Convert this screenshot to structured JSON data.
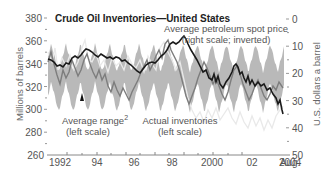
{
  "chart_data": {
    "type": "line",
    "title": "Crude Oil Inventories—United States",
    "ylabel": "Millions of barrels",
    "ylabel_right": "U.S. dollars a barrel",
    "ylim": [
      260,
      380
    ],
    "ylim_right": [
      0,
      50
    ],
    "right_axis_inverted": true,
    "yticks": [
      "380",
      "360",
      "340",
      "320",
      "300",
      "280",
      "260"
    ],
    "yticks_right": [
      "0",
      "10",
      "20",
      "30",
      "40",
      "50"
    ],
    "xticks": [
      "1992",
      "94",
      "96",
      "98",
      "2000",
      "02",
      "Aug.",
      "2004"
    ],
    "x_range": [
      1991.6,
      2004.6
    ],
    "grid": false,
    "series": [
      {
        "name": "Average petroleum spot price (right scale; inverted)",
        "axis": "right",
        "color": "#1a1a1a",
        "x": [
          1991.6,
          1992.0,
          1992.5,
          1993.0,
          1993.5,
          1994.0,
          1994.5,
          1995.0,
          1995.5,
          1996.0,
          1996.5,
          1997.0,
          1997.5,
          1998.0,
          1998.5,
          1998.8,
          1999.0,
          1999.5,
          2000.0,
          2000.5,
          2001.0,
          2001.5,
          2001.8,
          2002.0,
          2002.5,
          2003.0,
          2003.5,
          2004.0,
          2004.4,
          2004.6
        ],
        "values": [
          19,
          21,
          19,
          18,
          15,
          13,
          14,
          15,
          16,
          17,
          20,
          17,
          16,
          14,
          9,
          7,
          11,
          17,
          23,
          26,
          25,
          29,
          22,
          24,
          26,
          28,
          29,
          31,
          34,
          37
        ]
      },
      {
        "name": "Actual inventories (left scale)",
        "axis": "left",
        "color": "#7a7a7a",
        "x": [
          1991.6,
          1992.0,
          1992.5,
          1993.0,
          1993.5,
          1994.0,
          1994.5,
          1995.0,
          1995.5,
          1996.0,
          1996.5,
          1997.0,
          1997.5,
          1998.0,
          1998.5,
          1999.0,
          1999.5,
          2000.0,
          2000.5,
          2001.0,
          2001.5,
          2002.0,
          2002.5,
          2003.0,
          2003.5,
          2004.0,
          2004.6
        ],
        "values": [
          335,
          342,
          326,
          330,
          322,
          318,
          326,
          315,
          300,
          298,
          292,
          310,
          318,
          338,
          345,
          325,
          300,
          292,
          286,
          302,
          312,
          318,
          300,
          284,
          292,
          296,
          300
        ]
      },
      {
        "name": "Average range (left scale) upper bound",
        "axis": "left",
        "color": "#b9b9b9",
        "description": "Seasonal band, upper edge oscillating roughly 325–350"
      },
      {
        "name": "Average range (left scale) lower bound",
        "axis": "left",
        "color": "#b9b9b9",
        "description": "Seasonal band, lower edge oscillating roughly 290–318"
      }
    ],
    "annotations": [
      {
        "text": "Average petroleum spot price",
        "sub": "(right scale; inverted)"
      },
      {
        "text": "Average range",
        "superscript": "2",
        "sub": "(left scale)"
      },
      {
        "text": "Actual inventories",
        "sub": "(left scale)"
      }
    ]
  },
  "labels": {
    "title": "Crude Oil Inventories—United States",
    "ylabel_left": "Millions of barrels",
    "ylabel_right": "U.S. dollars a barrel",
    "price_annot_1": "Average petroleum spot price",
    "price_annot_2": "(right scale; inverted)",
    "range_annot_1": "Average range",
    "range_annot_sup": "2",
    "range_annot_2": "(left scale)",
    "inv_annot_1": "Actual inventories",
    "inv_annot_2": "(left scale)",
    "yticks_left": [
      "380",
      "360",
      "340",
      "320",
      "300",
      "280",
      "260"
    ],
    "yticks_right": [
      "0",
      "10",
      "20",
      "30",
      "40",
      "50"
    ],
    "xticks": [
      "1992",
      "94",
      "96",
      "98",
      "2000",
      "02"
    ],
    "xtick_last_1": "Aug.",
    "xtick_last_2": "2004"
  },
  "colors": {
    "band": "#b9b9b9",
    "price_line": "#1a1a1a",
    "inventory_line": "#7d7d7d",
    "light_line": "#e6e6e6",
    "axis": "#888888"
  }
}
